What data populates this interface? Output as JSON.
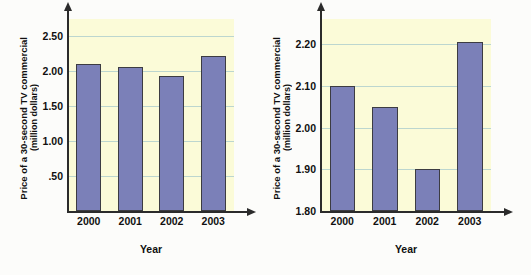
{
  "chart_data": [
    {
      "id": "left",
      "type": "bar",
      "title": "",
      "xlabel": "Year",
      "ylabel": "Price of a 30-second TV commercial (million dollars)",
      "ylabel_line1": "Price of a 30-second TV commercial",
      "ylabel_line2": "(million dollars)",
      "categories": [
        "2000",
        "2001",
        "2002",
        "2003"
      ],
      "values": [
        2.11,
        2.06,
        1.93,
        2.22
      ],
      "ylim": [
        0,
        2.75
      ],
      "yticks": [
        0.5,
        1.0,
        1.5,
        2.0,
        2.5
      ],
      "ytick_labels": [
        ".50",
        "1.00",
        "1.50",
        "2.00",
        "2.50"
      ],
      "grid": true,
      "legend": "none",
      "bar_color": "#7b80b8",
      "bar_border_color": "#3c3c42",
      "plot_bg": "#fbfbd8",
      "grid_color": "#bcd6cf",
      "axis_color": "#2b2b2b"
    },
    {
      "id": "right",
      "type": "bar",
      "title": "",
      "xlabel": "Year",
      "ylabel": "Price of a 30-second TV commercial (million dollars)",
      "ylabel_line1": "Price of a 30-second TV commercial",
      "ylabel_line2": "(million dollars)",
      "categories": [
        "2000",
        "2001",
        "2002",
        "2003"
      ],
      "values": [
        2.1,
        2.05,
        1.9,
        2.205
      ],
      "ylim": [
        1.8,
        2.26
      ],
      "yticks": [
        1.8,
        1.9,
        2.0,
        2.1,
        2.2
      ],
      "ytick_labels": [
        "1.80",
        "1.90",
        "2.00",
        "2.10",
        "2.20"
      ],
      "grid": true,
      "legend": "none",
      "bar_color": "#7b80b8",
      "bar_border_color": "#3c3c42",
      "plot_bg": "#fbfbd8",
      "grid_color": "#bcd6cf",
      "axis_color": "#2b2b2b"
    }
  ],
  "page": {
    "background": "#fcfcfa"
  }
}
